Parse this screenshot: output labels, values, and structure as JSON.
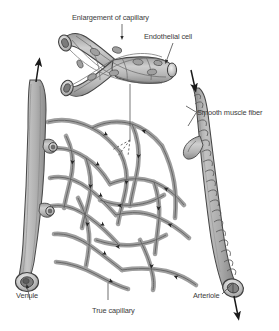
{
  "figure": {
    "background_color": "#ffffff",
    "width": 279,
    "height": 331
  },
  "palette": {
    "vessel_fill": "#b0b0b0",
    "vessel_fill_light": "#c8c8c8",
    "vessel_fill_dark": "#8f8f8f",
    "outline": "#4a4a4a",
    "outline_dark": "#333333",
    "label_text": "#3b3b3b",
    "leader_line": "#555555",
    "arrow_fill": "#1a1a1a",
    "lumen": "#e8e8e8",
    "nucleus": "#9a9a9a"
  },
  "labels": {
    "enlargement": {
      "text": "Enlargement of capillary",
      "x": 72,
      "y": 13,
      "anchor": "leader-down-to-enlarged-capillary"
    },
    "endothelial_cell": {
      "text": "Endothelial cell",
      "x": 144,
      "y": 32,
      "anchor": "leader-down-to-cell-nucleus"
    },
    "smooth_muscle_fiber": {
      "text": "Smooth muscle fiber",
      "x": 197,
      "y": 108,
      "anchor": "two-pronged-leader-to-arteriole-wall"
    },
    "venule": {
      "text": "Venule",
      "x": 16,
      "y": 291,
      "anchor": "leader-up-to-venule-mouth"
    },
    "true_capillary": {
      "text": "True capillary",
      "x": 92,
      "y": 306,
      "anchor": "leader-up-to-capillary-bed"
    },
    "arteriole": {
      "text": "Arteriole",
      "x": 193,
      "y": 291,
      "anchor": "leader-up-right-to-arteriole-mouth"
    }
  },
  "flow": {
    "venule_direction": "up-and-out",
    "arteriole_direction": "down-and-in",
    "venule_arrow_label": "blood flow out of capillary bed",
    "arteriole_arrow_label": "blood flow into capillary bed"
  },
  "structures": {
    "venule": "thick smooth-walled vessel on the left with open circular mouth at bottom",
    "arteriole": "banded smooth-muscle-wrapped vessel on the right with open mouth at bottom",
    "capillary_bed": "dense irregular mesh of true capillaries between arteriole and venule",
    "enlarged_capillary": "Y-branched tube at top showing endothelial cells with oval nuclei"
  }
}
